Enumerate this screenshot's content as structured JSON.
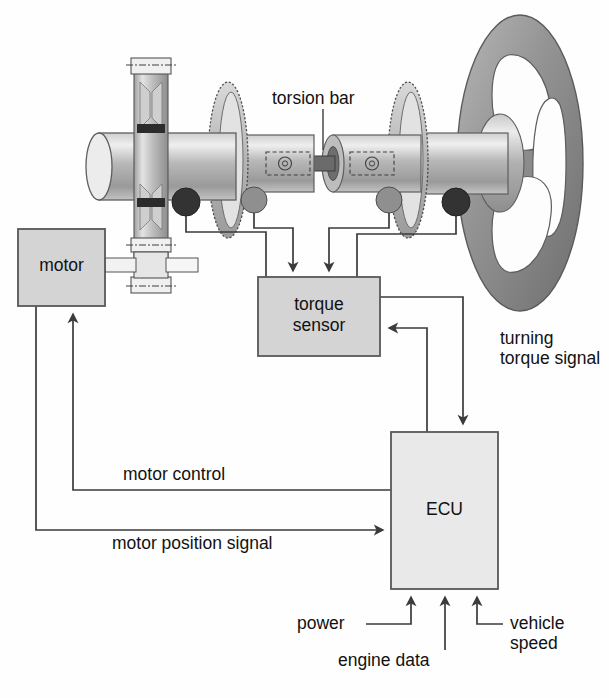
{
  "diagram": {
    "background": "#fefefe",
    "stroke": "#4a4a4a",
    "box_fill": "#d4d4d4",
    "ecu_fill": "#e6e6e6",
    "shaft_light": "#e9e9e9",
    "shaft_mid": "#a9a9a9",
    "shaft_dark": "#6f6f6f",
    "wheel_grey": "#8c8c8c",
    "coil_dark": "#3a3a3a",
    "coil_light": "#8f8f8f"
  },
  "boxes": [
    {
      "id": "motor",
      "label": "motor",
      "x": 18,
      "y": 229,
      "w": 87,
      "h": 77
    },
    {
      "id": "torque_sensor",
      "label": "torque\nsensor",
      "x": 258,
      "y": 277,
      "w": 122,
      "h": 79
    },
    {
      "id": "ecu",
      "label": "ECU",
      "x": 391,
      "y": 432,
      "w": 107,
      "h": 157
    }
  ],
  "callouts": [
    {
      "id": "torsion_bar",
      "label": "torsion bar",
      "x": 272,
      "y": 88
    },
    {
      "id": "turning_torque_signal",
      "label": "turning\ntorque signal",
      "x": 500,
      "y": 328
    },
    {
      "id": "motor_control",
      "label": "motor control",
      "x": 123,
      "y": 464
    },
    {
      "id": "motor_position_signal",
      "label": "motor position signal",
      "x": 112,
      "y": 533
    },
    {
      "id": "power",
      "label": "power",
      "x": 297,
      "y": 620
    },
    {
      "id": "engine_data",
      "label": "engine data",
      "x": 338,
      "y": 657
    },
    {
      "id": "vehicle_speed",
      "label": "vehicle\nspeed",
      "x": 510,
      "y": 620
    }
  ],
  "signals": [
    {
      "id": "sensor-coil-1-to-torque-sensor",
      "from": "coil-dark-left",
      "to": "torque-sensor",
      "arrow": false
    },
    {
      "id": "sensor-coil-2-to-torque-sensor",
      "from": "coil-light-left",
      "to": "torque-sensor",
      "arrow": true
    },
    {
      "id": "sensor-coil-3-to-torque-sensor",
      "from": "coil-light-right",
      "to": "torque-sensor",
      "arrow": true
    },
    {
      "id": "sensor-coil-4-to-torque-sensor",
      "from": "coil-dark-right",
      "to": "torque-sensor",
      "arrow": false
    },
    {
      "id": "torque-sensor-to-ecu",
      "from": "torque-sensor",
      "to": "ecu",
      "arrow": true
    },
    {
      "id": "ecu-to-torque-sensor",
      "from": "ecu",
      "to": "torque-sensor",
      "arrow": true
    },
    {
      "id": "ecu-to-motor",
      "from": "ecu",
      "to": "motor",
      "arrow": true
    },
    {
      "id": "motor-to-ecu",
      "from": "motor",
      "to": "ecu",
      "arrow": true
    },
    {
      "id": "power-to-ecu",
      "from": "power",
      "to": "ecu",
      "arrow": true
    },
    {
      "id": "engine-data-to-ecu",
      "from": "engine-data",
      "to": "ecu",
      "arrow": true
    },
    {
      "id": "vehicle-speed-to-ecu",
      "from": "vehicle-speed",
      "to": "ecu",
      "arrow": true
    }
  ],
  "mechanical_parts": [
    {
      "id": "steering-wheel",
      "name": "steering wheel"
    },
    {
      "id": "steering-shaft",
      "name": "steering shaft"
    },
    {
      "id": "torsion-bar",
      "name": "torsion bar"
    },
    {
      "id": "toothed-wheel-left",
      "name": "toothed sensor wheel (left)"
    },
    {
      "id": "toothed-wheel-right",
      "name": "toothed sensor wheel (right)"
    },
    {
      "id": "gear-housing",
      "name": "rack / gear housing"
    },
    {
      "id": "pinion-shaft",
      "name": "motor pinion shaft"
    }
  ]
}
